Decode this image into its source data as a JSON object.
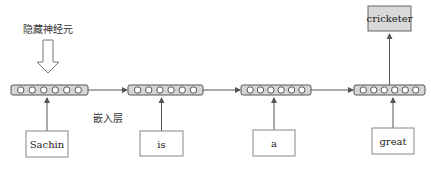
{
  "labels": {
    "hidden_neurons": "隐藏神经元",
    "embedding_layer": "嵌入层"
  },
  "inputs": [
    "Sachin",
    "is",
    "a",
    "great"
  ],
  "output": "cricketer",
  "hidden_units_per_step": 6,
  "colors": {
    "hidden_fill": "#d6d6d6",
    "output_fill": "#d9d9d9",
    "stroke": "#555555",
    "circle_fill": "#ffffff"
  }
}
